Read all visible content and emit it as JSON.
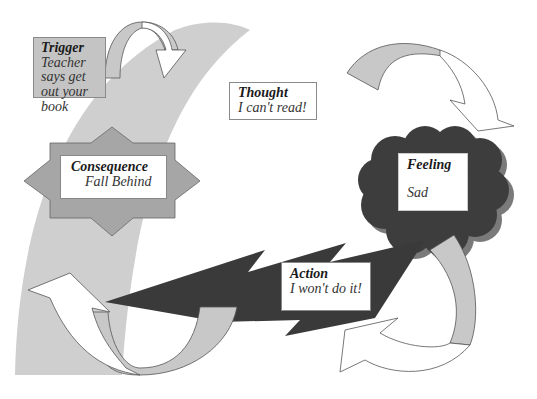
{
  "diagram": {
    "type": "cognitive-behavioral cycle",
    "colors": {
      "arc": "#cfcfcf",
      "star": "#a6a6a6",
      "cloud": "#3d3d3d",
      "cloud_shadow": "#7a7a7a",
      "bolt": "#3a3a3a",
      "arrow_gray": "#c8c8c8",
      "arrow_white": "#ffffff",
      "trigger_fill": "#c4c4c4"
    },
    "nodes": {
      "trigger": {
        "title": "Trigger",
        "text": "Teacher says get out your book"
      },
      "thought": {
        "title": "Thought",
        "text": "I can't read!"
      },
      "feeling": {
        "title": "Feeling",
        "text": "Sad"
      },
      "action": {
        "title": "Action",
        "text": "I won't do it!"
      },
      "consequence": {
        "title": "Consequence",
        "text": "Fall Behind"
      }
    },
    "flow": [
      "trigger",
      "thought",
      "feeling",
      "action",
      "consequence",
      "trigger"
    ]
  }
}
